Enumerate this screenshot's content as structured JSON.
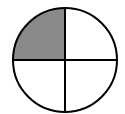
{
  "diagram": {
    "type": "fraction-circle",
    "total_parts": 4,
    "shaded_parts": 1,
    "fraction_shaded": "1/4",
    "shaded_quadrant": "top-left",
    "colors": {
      "shaded": "#8a8a8a",
      "unshaded": "#ffffff",
      "stroke": "#000000"
    }
  }
}
